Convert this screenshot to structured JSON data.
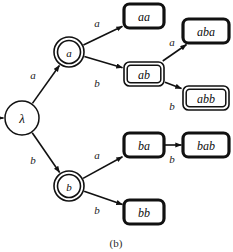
{
  "figure": {
    "caption": "(b)",
    "colors": {
      "stroke": "#111111",
      "background": "#ffffff",
      "text": "#0d0d0d"
    }
  },
  "nodes": [
    {
      "id": "root",
      "label": "λ",
      "shape": "circle",
      "accepting": false,
      "x": 22,
      "y": 118,
      "rx": 17,
      "ry": 17,
      "font_size": 13
    },
    {
      "id": "a",
      "label": "a",
      "shape": "circle",
      "accepting": true,
      "x": 69,
      "y": 52,
      "rx": 15,
      "ry": 15,
      "font_size": 11
    },
    {
      "id": "b",
      "label": "b",
      "shape": "circle",
      "accepting": true,
      "x": 69,
      "y": 186,
      "rx": 15,
      "ry": 15,
      "font_size": 11
    },
    {
      "id": "aa",
      "label": "aa",
      "shape": "rect",
      "accepting": false,
      "x": 144,
      "y": 16,
      "w": 40,
      "h": 24,
      "font_size": 12
    },
    {
      "id": "ab",
      "label": "ab",
      "shape": "rect",
      "accepting": true,
      "x": 144,
      "y": 74,
      "w": 40,
      "h": 24,
      "font_size": 12
    },
    {
      "id": "aba",
      "label": "aba",
      "shape": "rect",
      "accepting": false,
      "x": 206,
      "y": 31,
      "w": 46,
      "h": 24,
      "font_size": 12
    },
    {
      "id": "abb",
      "label": "abb",
      "shape": "rect",
      "accepting": true,
      "x": 206,
      "y": 98,
      "w": 46,
      "h": 24,
      "font_size": 12
    },
    {
      "id": "ba",
      "label": "ba",
      "shape": "rect",
      "accepting": false,
      "x": 144,
      "y": 145,
      "w": 40,
      "h": 24,
      "font_size": 12
    },
    {
      "id": "bab",
      "label": "bab",
      "shape": "rect",
      "accepting": false,
      "x": 206,
      "y": 145,
      "w": 46,
      "h": 24,
      "font_size": 12
    },
    {
      "id": "bb",
      "label": "bb",
      "shape": "rect",
      "accepting": false,
      "x": 144,
      "y": 212,
      "w": 40,
      "h": 24,
      "font_size": 12
    }
  ],
  "edges": [
    {
      "id": "root-a",
      "from": "root",
      "to": "a",
      "label": "a",
      "label_x": 33,
      "label_y": 75
    },
    {
      "id": "root-b",
      "from": "root",
      "to": "b",
      "label": "b",
      "label_x": 33,
      "label_y": 160
    },
    {
      "id": "a-aa",
      "from": "a",
      "to": "aa",
      "label": "a",
      "label_x": 97,
      "label_y": 23
    },
    {
      "id": "a-ab",
      "from": "a",
      "to": "ab",
      "label": "b",
      "label_x": 97,
      "label_y": 83
    },
    {
      "id": "ab-aba",
      "from": "ab",
      "to": "aba",
      "label": "a",
      "label_x": 172,
      "label_y": 42
    },
    {
      "id": "ab-abb",
      "from": "ab",
      "to": "abb",
      "label": "b",
      "label_x": 172,
      "label_y": 106
    },
    {
      "id": "b-ba",
      "from": "b",
      "to": "ba",
      "label": "a",
      "label_x": 97,
      "label_y": 155
    },
    {
      "id": "ba-bab",
      "from": "ba",
      "to": "bab",
      "label": "b",
      "label_x": 172,
      "label_y": 159
    },
    {
      "id": "b-bb",
      "from": "b",
      "to": "bb",
      "label": "b",
      "label_x": 97,
      "label_y": 210
    }
  ],
  "start_arrow": {
    "id": "start-arrow",
    "target": "root",
    "x1": 0,
    "y1": 118,
    "x2": 5,
    "y2": 118
  }
}
